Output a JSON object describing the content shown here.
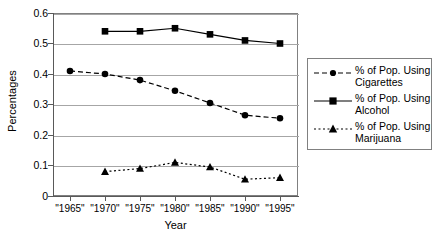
{
  "chart_data": {
    "type": "line",
    "title": "",
    "xlabel": "Year",
    "ylabel": "Percentages",
    "categories": [
      "\"1965\"",
      "\"1970\"",
      "\"1975\"",
      "\"1980\"",
      "\"1985\"",
      "\"1990\"",
      "\"1995\""
    ],
    "x_values": [
      1965,
      1970,
      1975,
      1980,
      1985,
      1990,
      1995
    ],
    "ylim": [
      0,
      0.6
    ],
    "yticks": [
      0,
      0.1,
      0.2,
      0.3,
      0.4,
      0.5,
      0.6
    ],
    "ytick_labels": [
      "0",
      "0.1",
      "0.2",
      "0.3",
      "0.4",
      "0.5",
      "0.6"
    ],
    "grid": true,
    "grid_axis": "y",
    "legend_position": "right",
    "series": [
      {
        "name": "% of Pop. Using Cigarettes",
        "label_line1": "% of Pop. Using",
        "label_line2": "Cigarettes",
        "marker": "circle",
        "linestyle": "dashed",
        "color": "#000000",
        "values": [
          0.41,
          0.4,
          0.38,
          0.345,
          0.305,
          0.265,
          0.255
        ]
      },
      {
        "name": "% of Pop. Using Alcohol",
        "label_line1": "% of Pop. Using",
        "label_line2": "Alcohol",
        "marker": "square",
        "linestyle": "solid",
        "color": "#000000",
        "values": [
          null,
          0.54,
          0.54,
          0.55,
          0.53,
          0.51,
          0.5
        ]
      },
      {
        "name": "% of Pop. Using Marijuana",
        "label_line1": "% of Pop. Using",
        "label_line2": "Marijuana",
        "marker": "triangle",
        "linestyle": "dotted",
        "color": "#000000",
        "values": [
          null,
          0.08,
          0.09,
          0.11,
          0.095,
          0.055,
          0.06
        ]
      }
    ]
  },
  "legend": {
    "entries": [
      {
        "line1": "% of Pop. Using",
        "line2": "Cigarettes"
      },
      {
        "line1": "% of Pop. Using",
        "line2": "Alcohol"
      },
      {
        "line1": "% of Pop. Using",
        "line2": "Marijuana"
      }
    ]
  },
  "axes": {
    "y_title": "Percentages",
    "x_title": "Year",
    "y_labels": [
      "0.6",
      "0.5",
      "0.4",
      "0.3",
      "0.2",
      "0.1",
      "0"
    ],
    "x_labels": [
      "\"1965\"",
      "\"1970\"",
      "\"1975\"",
      "\"1980\"",
      "\"1985\"",
      "\"1990\"",
      "\"1995\""
    ]
  },
  "colors": {
    "ink": "#000000",
    "grid": "#a6a6a6",
    "frame": "#808080",
    "background": "#ffffff"
  }
}
